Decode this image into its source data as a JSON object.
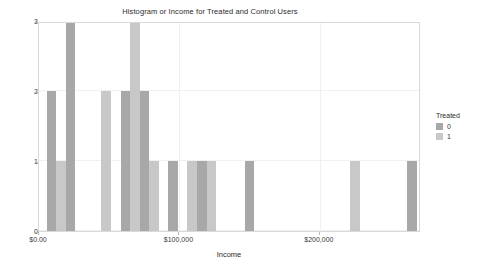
{
  "chart_data": {
    "type": "bar",
    "title": "Histogram or Income for Treated and Control Users",
    "xlabel": "Income",
    "ylabel": "Count",
    "xlim": [
      0,
      272000
    ],
    "ylim": [
      0,
      3
    ],
    "grid": true,
    "legend_position": "right",
    "x_tick_labels": [
      "$0.00",
      "$100,000",
      "$200,000"
    ],
    "x_tick_values": [
      0,
      100000,
      200000
    ],
    "y_tick_labels": [
      "0",
      "1",
      "2",
      "3"
    ],
    "y_tick_values": [
      0,
      1,
      2,
      3
    ],
    "bin_width": 6800,
    "legend": {
      "title": "Treated",
      "entries": [
        {
          "label": "0",
          "color": "#a8a8a8"
        },
        {
          "label": "1",
          "color": "#c8c8c8"
        }
      ]
    },
    "series": [
      {
        "name": "0",
        "color": "#a8a8a8"
      },
      {
        "name": "1",
        "color": "#c8c8c8"
      }
    ],
    "bars": [
      {
        "x0": 5500,
        "x1": 12300,
        "count": 2,
        "series": "0"
      },
      {
        "x0": 12300,
        "x1": 19100,
        "count": 1,
        "series": "1"
      },
      {
        "x0": 19100,
        "x1": 25900,
        "count": 3,
        "series": "0"
      },
      {
        "x0": 44500,
        "x1": 51300,
        "count": 2,
        "series": "1"
      },
      {
        "x0": 58100,
        "x1": 64900,
        "count": 2,
        "series": "0"
      },
      {
        "x0": 64900,
        "x1": 71700,
        "count": 3,
        "series": "1"
      },
      {
        "x0": 71700,
        "x1": 78500,
        "count": 2,
        "series": "0"
      },
      {
        "x0": 78500,
        "x1": 85300,
        "count": 1,
        "series": "1"
      },
      {
        "x0": 92100,
        "x1": 98900,
        "count": 1,
        "series": "0"
      },
      {
        "x0": 105700,
        "x1": 112500,
        "count": 1,
        "series": "1"
      },
      {
        "x0": 112500,
        "x1": 119300,
        "count": 1,
        "series": "0"
      },
      {
        "x0": 119300,
        "x1": 126100,
        "count": 1,
        "series": "1"
      },
      {
        "x0": 146500,
        "x1": 153300,
        "count": 1,
        "series": "0"
      },
      {
        "x0": 221700,
        "x1": 228500,
        "count": 1,
        "series": "1"
      },
      {
        "x0": 262100,
        "x1": 268900,
        "count": 1,
        "series": "0"
      }
    ]
  }
}
